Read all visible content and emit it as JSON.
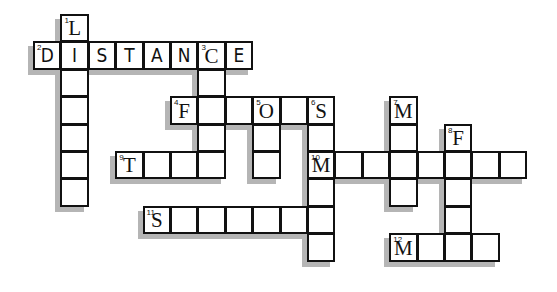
{
  "puzzle": {
    "type": "crossword",
    "grid": {
      "origin_x": 33,
      "origin_y": 14,
      "cell_size": 27.4
    },
    "colors": {
      "border": "#111111",
      "shadow": "#b5b5b5",
      "background": "#ffffff"
    },
    "entries": [
      {
        "number": 1,
        "direction": "down",
        "col": 1,
        "row": 0,
        "length": 7,
        "given": "L"
      },
      {
        "number": 2,
        "direction": "across",
        "col": 0,
        "row": 1,
        "length": 8,
        "given": "DISTANCE",
        "handwritten": true
      },
      {
        "number": 3,
        "direction": "down",
        "col": 6,
        "row": 1,
        "length": 5,
        "given": "C"
      },
      {
        "number": 4,
        "direction": "across",
        "col": 5,
        "row": 3,
        "length": 6,
        "given": "F"
      },
      {
        "number": 5,
        "direction": "down",
        "col": 8,
        "row": 3,
        "length": 3,
        "given": "O"
      },
      {
        "number": 6,
        "direction": "down",
        "col": 10,
        "row": 3,
        "length": 6,
        "given": "S"
      },
      {
        "number": 7,
        "direction": "down",
        "col": 13,
        "row": 3,
        "length": 4,
        "given": "M"
      },
      {
        "number": 8,
        "direction": "down",
        "col": 15,
        "row": 4,
        "length": 5,
        "given": "F"
      },
      {
        "number": 9,
        "direction": "across",
        "col": 3,
        "row": 5,
        "length": 4,
        "given": "T"
      },
      {
        "number": 10,
        "direction": "across",
        "col": 10,
        "row": 5,
        "length": 8,
        "given": "M"
      },
      {
        "number": 11,
        "direction": "across",
        "col": 4,
        "row": 7,
        "length": 7,
        "given": "S"
      },
      {
        "number": 12,
        "direction": "across",
        "col": 13,
        "row": 8,
        "length": 4,
        "given": "M"
      }
    ]
  }
}
